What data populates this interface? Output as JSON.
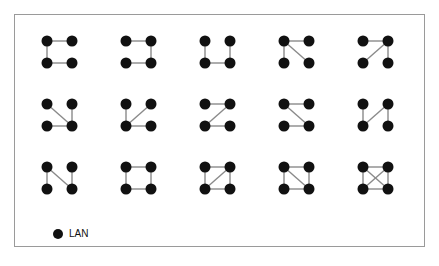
{
  "diagram": {
    "type": "network-topology-grid",
    "node_color": "#111111",
    "edge_color": "#8a8a8a",
    "node_radius": 5.5,
    "node_positions": {
      "TL": [
        0,
        0
      ],
      "TR": [
        25,
        0
      ],
      "BL": [
        0,
        22
      ],
      "BR": [
        25,
        22
      ]
    },
    "column_x": [
      47,
      126,
      205,
      284,
      363
    ],
    "row_y": [
      41,
      104,
      167
    ],
    "graphs": [
      {
        "id": 1,
        "edges": [
          [
            "TL",
            "TR"
          ],
          [
            "TL",
            "BL"
          ],
          [
            "BL",
            "BR"
          ]
        ]
      },
      {
        "id": 2,
        "edges": [
          [
            "TL",
            "TR"
          ],
          [
            "TR",
            "BR"
          ],
          [
            "BL",
            "BR"
          ]
        ]
      },
      {
        "id": 3,
        "edges": [
          [
            "TL",
            "BL"
          ],
          [
            "BL",
            "BR"
          ],
          [
            "TR",
            "BR"
          ]
        ]
      },
      {
        "id": 4,
        "edges": [
          [
            "TL",
            "TR"
          ],
          [
            "TL",
            "BL"
          ],
          [
            "TL",
            "BR"
          ]
        ]
      },
      {
        "id": 5,
        "edges": [
          [
            "TL",
            "TR"
          ],
          [
            "TR",
            "BL"
          ],
          [
            "TR",
            "BR"
          ]
        ]
      },
      {
        "id": 6,
        "edges": [
          [
            "TL",
            "BR"
          ],
          [
            "TR",
            "BR"
          ],
          [
            "BL",
            "BR"
          ]
        ]
      },
      {
        "id": 7,
        "edges": [
          [
            "TL",
            "BL"
          ],
          [
            "TR",
            "BL"
          ],
          [
            "BL",
            "BR"
          ]
        ]
      },
      {
        "id": 8,
        "edges": [
          [
            "TL",
            "TR"
          ],
          [
            "TR",
            "BL"
          ],
          [
            "BL",
            "BR"
          ]
        ]
      },
      {
        "id": 9,
        "edges": [
          [
            "TL",
            "TR"
          ],
          [
            "TL",
            "BR"
          ],
          [
            "BL",
            "BR"
          ]
        ]
      },
      {
        "id": 10,
        "edges": [
          [
            "TL",
            "BL"
          ],
          [
            "BL",
            "TR"
          ],
          [
            "TR",
            "BR"
          ]
        ]
      },
      {
        "id": 11,
        "edges": [
          [
            "TL",
            "BL"
          ],
          [
            "TL",
            "BR"
          ],
          [
            "TR",
            "BR"
          ]
        ]
      },
      {
        "id": 12,
        "edges": [
          [
            "TL",
            "TR"
          ],
          [
            "TR",
            "BR"
          ],
          [
            "BR",
            "BL"
          ],
          [
            "BL",
            "TL"
          ]
        ]
      },
      {
        "id": 13,
        "edges": [
          [
            "TL",
            "TR"
          ],
          [
            "TR",
            "BR"
          ],
          [
            "BR",
            "BL"
          ],
          [
            "BL",
            "TL"
          ],
          [
            "TR",
            "BL"
          ]
        ]
      },
      {
        "id": 14,
        "edges": [
          [
            "TL",
            "TR"
          ],
          [
            "TR",
            "BR"
          ],
          [
            "BR",
            "BL"
          ],
          [
            "BL",
            "TL"
          ],
          [
            "TL",
            "BR"
          ]
        ]
      },
      {
        "id": 15,
        "edges": [
          [
            "TL",
            "TR"
          ],
          [
            "TR",
            "BR"
          ],
          [
            "BR",
            "BL"
          ],
          [
            "BL",
            "TL"
          ],
          [
            "TL",
            "BR"
          ],
          [
            "TR",
            "BL"
          ]
        ]
      }
    ]
  },
  "legend": {
    "symbol": "filled-circle",
    "label": "LAN"
  }
}
